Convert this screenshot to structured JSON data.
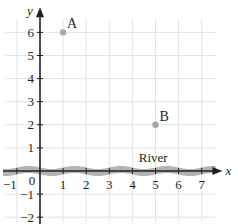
{
  "chart_data": {
    "type": "scatter",
    "title": "",
    "xlabel": "x",
    "ylabel": "y",
    "xlim": [
      -1.5,
      7.6
    ],
    "ylim": [
      -2.2,
      6.7
    ],
    "grid": true,
    "x_ticks": [
      -1,
      0,
      1,
      2,
      3,
      4,
      5,
      6,
      7
    ],
    "y_ticks": [
      -2,
      -1,
      1,
      2,
      3,
      4,
      5,
      6
    ],
    "origin_label": "0",
    "points": [
      {
        "label": "A",
        "x": 1,
        "y": 6
      },
      {
        "label": "B",
        "x": 5,
        "y": 2
      }
    ],
    "annotations": [
      {
        "text": "River",
        "x": 4.9,
        "y": 0.4,
        "note": "wavy gray band along the x-axis"
      }
    ],
    "colors": {
      "grid": "#e3e3e3",
      "axis": "#231f20",
      "point": "#a8a8a8",
      "river": "#b3b3b3"
    }
  }
}
